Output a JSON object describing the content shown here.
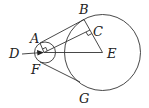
{
  "diagram": {
    "type": "geometry",
    "labels": {
      "A": "A",
      "B": "B",
      "C": "C",
      "D": "D",
      "E": "E",
      "F": "F",
      "G": "G"
    },
    "stroke_color": "#333333",
    "text_color": "#222222",
    "background": "#ffffff"
  }
}
